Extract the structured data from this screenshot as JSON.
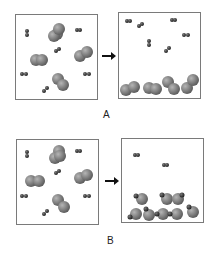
{
  "diagram": {
    "panels": [
      {
        "id": "A",
        "label": "A",
        "before": "Gas-phase mixture of large diatomic molecules and small diatomic molecules",
        "after": "Large molecules condensed at bottom; small molecules remain as gas"
      },
      {
        "id": "B",
        "label": "B",
        "before": "Gas-phase mixture of large diatomic molecules and small diatomic molecules",
        "after": "Products formed as combined molecules at bottom; two small molecules remain as gas"
      }
    ],
    "arrow_icon": "right-arrow-icon",
    "colors": {
      "large_sphere": "#7a7a7a",
      "small_sphere": "#3a3a3a",
      "border": "#7a7a7a"
    }
  }
}
